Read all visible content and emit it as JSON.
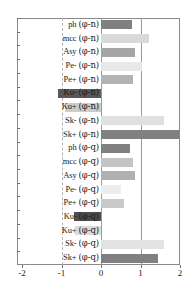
{
  "chart_data": {
    "type": "bar",
    "orientation": "horizontal",
    "title": "",
    "subtitle": "",
    "xlabel": "",
    "ylabel": "",
    "xlim": [
      -2,
      2
    ],
    "xticks": [
      -2,
      -1,
      0,
      1,
      2
    ],
    "xtick_labels": [
      "-2",
      "-1",
      "0",
      "1",
      "2"
    ],
    "grid": true,
    "gridlines_x": [
      -1,
      0,
      1
    ],
    "legend": "none",
    "categories": [
      "ph (φ-n)",
      "mcc (φ-n)",
      "Asy (φ-n)",
      "Pe- (φ-n)",
      "Pe+ (φ-n)",
      "Ku- (φ-n)",
      "Ku+ (φ-n)",
      "Sk- (φ-n)",
      "Sk+ (φ-n)",
      "ph (φ-q)",
      "mcc (φ-q)",
      "Asy (φ-q)",
      "Pe- (φ-q)",
      "Pe+ (φ-q)",
      "Ku- (φ-q)",
      "Ku+ (φ-q)",
      "Sk- (φ-q)",
      "Sk+ (φ-q)"
    ],
    "values": [
      0.79,
      1.21,
      0.85,
      1.04,
      0.82,
      -1.08,
      -0.92,
      1.6,
      1.97,
      0.74,
      0.8,
      0.85,
      0.51,
      0.57,
      -0.69,
      -0.67,
      1.6,
      1.45
    ],
    "bar_colors": [
      "#808080",
      "#d9d9d9",
      "#a6a6a6",
      "#e8e8e8",
      "#b3b3b3",
      "#595959",
      "#cccccc",
      "#e0e0e0",
      "#808080",
      "#808080",
      "#c4c4c4",
      "#b0b0b0",
      "#ededed",
      "#c9c9c9",
      "#4d4d4d",
      "#dcdcdc",
      "#e3e3e3",
      "#808080"
    ]
  },
  "rows": [
    {
      "prefix": "ph",
      "suffix": "(φ-n)",
      "value": 0.79,
      "color": "#808080"
    },
    {
      "prefix": "mcc",
      "suffix": "(φ-n)",
      "value": 1.21,
      "color": "#d9d9d9"
    },
    {
      "prefix": "Asy",
      "suffix": "(φ-n)",
      "value": 0.85,
      "color": "#a6a6a6"
    },
    {
      "prefix": "Pe-",
      "suffix": "(φ-n)",
      "value": 1.04,
      "color": "#e8e8e8"
    },
    {
      "prefix": "Pe+",
      "suffix": "(φ-n)",
      "value": 0.82,
      "color": "#b3b3b3"
    },
    {
      "prefix": "Ku-",
      "suffix": "(φ-n)",
      "value": -1.08,
      "color": "#595959"
    },
    {
      "prefix": "Ku+",
      "suffix": "(φ-n)",
      "value": -0.92,
      "color": "#cccccc"
    },
    {
      "prefix": "Sk-",
      "suffix": "(φ-n)",
      "value": 1.6,
      "color": "#e0e0e0"
    },
    {
      "prefix": "Sk+",
      "suffix": "(φ-n)",
      "value": 1.97,
      "color": "#808080"
    },
    {
      "prefix": "ph",
      "suffix": "(φ-q)",
      "value": 0.74,
      "color": "#808080"
    },
    {
      "prefix": "mcc",
      "suffix": "(φ-q)",
      "value": 0.8,
      "color": "#c4c4c4"
    },
    {
      "prefix": "Asy",
      "suffix": "(φ-q)",
      "value": 0.85,
      "color": "#b0b0b0"
    },
    {
      "prefix": "Pe-",
      "suffix": "(φ-q)",
      "value": 0.51,
      "color": "#ededed"
    },
    {
      "prefix": "Pe+",
      "suffix": "(φ-q)",
      "value": 0.57,
      "color": "#c9c9c9"
    },
    {
      "prefix": "Ku-",
      "suffix": "(φ-q)",
      "value": -0.69,
      "color": "#4d4d4d"
    },
    {
      "prefix": "Ku+",
      "suffix": "(φ-q)",
      "value": -0.67,
      "color": "#dcdcdc"
    },
    {
      "prefix": "Sk-",
      "suffix": "(φ-q)",
      "value": 1.6,
      "color": "#e3e3e3"
    },
    {
      "prefix": "Sk+",
      "suffix": "(φ-q)",
      "value": 1.45,
      "color": "#808080"
    }
  ],
  "axis": {
    "ticks": [
      "-2",
      "-1",
      "0",
      "1",
      "2"
    ],
    "tick_values": [
      -2,
      -1,
      0,
      1,
      2
    ]
  },
  "colors": {
    "frame": "#8a8a8a",
    "zero_line": "#9a9a9a",
    "dashed_grid": "#b4b4b4",
    "text": "#1a1a1a",
    "background": "#ffffff"
  }
}
